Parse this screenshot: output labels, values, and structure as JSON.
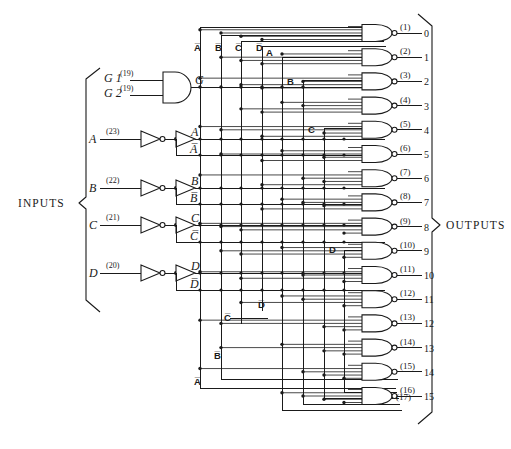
{
  "figure": {
    "kind": "logic-circuit-schematic",
    "background": "#ffffff",
    "ink": "#1a1a1a"
  },
  "labels": {
    "inputs_group": "INPUTS",
    "outputs_group": "OUTPUTS"
  },
  "enable_inputs": [
    {
      "name": "G 1",
      "pin": "(19)"
    },
    {
      "name": "G 2",
      "pin": "(19)"
    }
  ],
  "enable_gate": {
    "type": "and-gate",
    "output_label": "G"
  },
  "data_inputs": [
    {
      "name": "A",
      "pin": "(23)",
      "true_label": "A",
      "comp_label": "A̅"
    },
    {
      "name": "B",
      "pin": "(22)",
      "true_label": "B",
      "comp_label": "B̅"
    },
    {
      "name": "C",
      "pin": "(21)",
      "true_label": "C",
      "comp_label": "C̅"
    },
    {
      "name": "D",
      "pin": "(20)",
      "true_label": "D",
      "comp_label": "D̅"
    }
  ],
  "bus_labels_top": [
    {
      "text": "A̅"
    },
    {
      "text": "B̅"
    },
    {
      "text": "C̅"
    },
    {
      "text": "D̅"
    },
    {
      "text": "A"
    },
    {
      "text": "B"
    }
  ],
  "bus_labels_mid": [
    {
      "text": "C"
    },
    {
      "text": "D"
    }
  ],
  "bus_labels_low": [
    {
      "text": "C̅"
    },
    {
      "text": "D̅"
    },
    {
      "text": "B̅"
    },
    {
      "text": "A̅"
    }
  ],
  "outputs": [
    {
      "pin": "(1)",
      "label": "0"
    },
    {
      "pin": "(2)",
      "label": "1"
    },
    {
      "pin": "(3)",
      "label": "2"
    },
    {
      "pin": "(4)",
      "label": "3"
    },
    {
      "pin": "(5)",
      "label": "4"
    },
    {
      "pin": "(6)",
      "label": "5"
    },
    {
      "pin": "(7)",
      "label": "6"
    },
    {
      "pin": "(8)",
      "label": "7"
    },
    {
      "pin": "(9)",
      "label": "8"
    },
    {
      "pin": "(10)",
      "label": "9"
    },
    {
      "pin": "(11)",
      "label": "10"
    },
    {
      "pin": "(12)",
      "label": "11"
    },
    {
      "pin": "(13)",
      "label": "12"
    },
    {
      "pin": "(14)",
      "label": "13"
    },
    {
      "pin": "(15)",
      "label": "14"
    },
    {
      "pin": "(16)",
      "label": "15"
    }
  ],
  "output_pin_extra": "(17)",
  "geometry": {
    "output_gate_count": 16,
    "bus_column_count": 10,
    "first_output_y": 33,
    "output_pitch": 24.2
  }
}
